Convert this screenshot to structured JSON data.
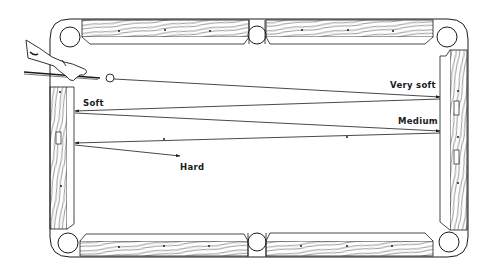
{
  "figure": {
    "type": "diagram",
    "labels": {
      "very_soft": "Very soft",
      "soft": "Soft",
      "medium": "Medium",
      "hard": "Hard"
    },
    "colors": {
      "ink": "#1a1a1a",
      "background": "#ffffff"
    },
    "elements": {
      "corner_pockets": 4,
      "side_pockets": 2,
      "cue_ball": "white circle at head of table",
      "hand_and_cue": "player's hand holding cue stick, upper-left"
    },
    "paths": [
      {
        "name": "very-soft",
        "from": "cue ball",
        "to": "right cushion"
      },
      {
        "name": "soft",
        "from": "right cushion",
        "to": "left cushion"
      },
      {
        "name": "medium",
        "from": "left cushion",
        "to": "right cushion"
      },
      {
        "name": "hard",
        "from": "right cushion",
        "to": "left cushion then back to table center"
      }
    ]
  }
}
